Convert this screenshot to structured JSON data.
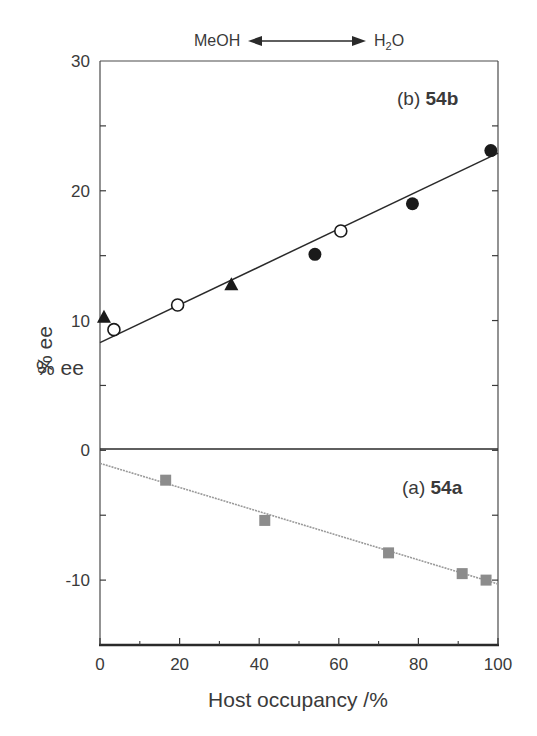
{
  "chart_data": {
    "type": "scatter",
    "title": "",
    "header_annotation": {
      "left": "MeOH",
      "right": "H2O",
      "arrow": "double-headed"
    },
    "xlabel": "Host occupancy /%",
    "ylabel": "% ee",
    "ylabel_duplicate_artifact": "% ee",
    "xlim": [
      0,
      100
    ],
    "ylim": [
      -15,
      30
    ],
    "x_ticks": [
      0,
      20,
      40,
      60,
      80,
      100
    ],
    "x_minor_ticks": [
      10,
      30,
      50,
      70,
      90
    ],
    "y_ticks": [
      -10,
      0,
      10,
      20,
      30
    ],
    "y_minor_ticks": [
      -5,
      5,
      15,
      25
    ],
    "grid": false,
    "zero_line": true,
    "panels": [
      {
        "label_prefix": "(b)",
        "label_compound": "54b",
        "series": [
          {
            "name": "54b filled triangles",
            "marker": "triangle-filled",
            "color": "#1a1a1a",
            "points": [
              [
                1,
                10.3
              ],
              [
                33,
                12.8
              ]
            ]
          },
          {
            "name": "54b open circles",
            "marker": "circle-open",
            "color": "#1a1a1a",
            "points": [
              [
                3.5,
                9.3
              ],
              [
                19.5,
                11.2
              ],
              [
                60.5,
                16.9
              ]
            ]
          },
          {
            "name": "54b filled circles",
            "marker": "circle-filled",
            "color": "#1a1a1a",
            "points": [
              [
                54,
                15.1
              ],
              [
                78.5,
                19.0
              ],
              [
                98.2,
                23.1
              ]
            ]
          }
        ],
        "fit_line": {
          "x": [
            0,
            100
          ],
          "y": [
            8.3,
            22.9
          ],
          "style": "solid",
          "color": "#2a2a2a"
        }
      },
      {
        "label_prefix": "(a)",
        "label_compound": "54a",
        "series": [
          {
            "name": "54a grey squares",
            "marker": "square-filled",
            "color": "#8c8c8c",
            "points": [
              [
                16.5,
                -2.3
              ],
              [
                41.4,
                -5.4
              ],
              [
                72.5,
                -7.9
              ],
              [
                91,
                -9.5
              ],
              [
                97,
                -10.0
              ]
            ]
          }
        ],
        "fit_line": {
          "x": [
            0,
            100
          ],
          "y": [
            -1.0,
            -10.3
          ],
          "style": "dotted",
          "color": "#9a9a9a"
        }
      }
    ]
  },
  "labels": {
    "header_left": "MeOH",
    "header_right_main": "H",
    "header_right_sub": "2",
    "header_right_tail": "O",
    "panel_b_prefix": "(b) ",
    "panel_b_compound": "54b",
    "panel_a_prefix": "(a) ",
    "panel_a_compound": "54a",
    "ylabel": "% ee",
    "ylabel_artifact": "% ee",
    "xlabel": "Host occupancy /%"
  }
}
